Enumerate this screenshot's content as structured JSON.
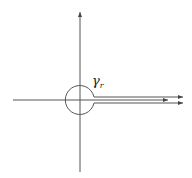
{
  "diagram": {
    "type": "keyhole-contour",
    "label": {
      "symbol": "γ",
      "subscript": "r"
    },
    "colors": {
      "stroke": "#555555",
      "background": "#ffffff"
    },
    "elements": {
      "vertical_axis": "arrow pointing up",
      "horizontal_axis": "line along real axis",
      "circle": "small circle of radius r around origin",
      "upper_ray": "ray above positive real axis with arrow to right",
      "lower_ray": "ray below positive real axis with arrow to right",
      "axis_ray": "positive real axis with arrow to right"
    }
  }
}
